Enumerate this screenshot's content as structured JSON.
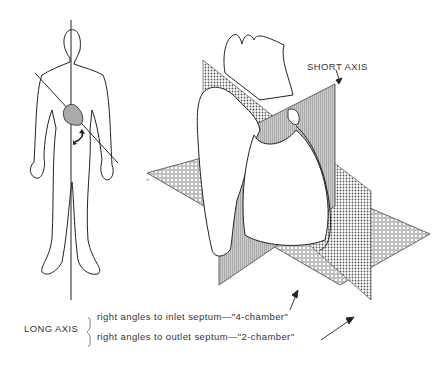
{
  "figure": {
    "labels": {
      "short_axis": "SHORT AXIS",
      "long_axis": "LONG AXIS",
      "long_axis_desc_1": "right angles to inlet septum—\"4-chamber\"",
      "long_axis_desc_2": "right angles to outlet septum—\"2-chamber\""
    },
    "elements": [
      "human-body-outline",
      "vertical-body-axis-line",
      "oblique-heart-axis-line",
      "heart-in-chest",
      "rotation-arrow",
      "heart-illustration",
      "short-axis-plane",
      "four-chamber-plane",
      "two-chamber-plane"
    ],
    "colors": {
      "line": "#222222",
      "plane_fill": "#b8b8b8",
      "background": "#ffffff"
    }
  }
}
